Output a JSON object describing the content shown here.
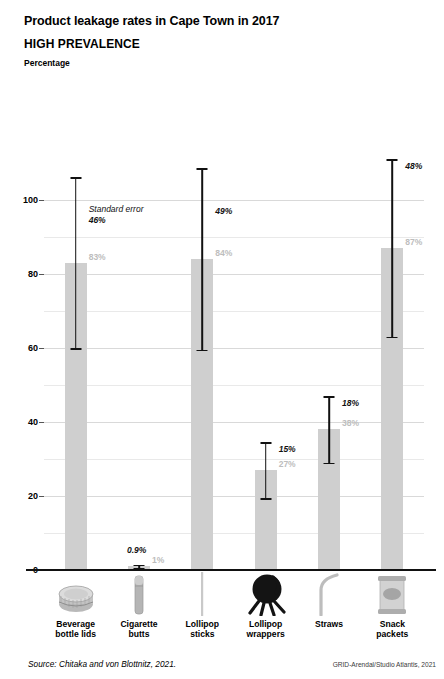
{
  "header": {
    "title": "Product leakage rates in Cape Town in 2017",
    "subtitle": "HIGH PREVALENCE",
    "axis_label": "Percentage"
  },
  "annotation": {
    "standard_error_note": "Standard error"
  },
  "footer": {
    "source": "Source: Chitaka and von Blottnitz, 2021.",
    "credit": "GRID-Arendal/Studio Atlantis, 2021"
  },
  "colors": {
    "bar": "#cfcfcf",
    "bar_label": "#bdbdbd",
    "error_bar": "#111111",
    "grid_major": "#d9d9d9",
    "grid_minor": "#e9e9e9",
    "axis": "#111111",
    "text": "#000000"
  },
  "chart_data": {
    "type": "bar",
    "title": "Product leakage rates in Cape Town in 2017",
    "subtitle": "HIGH PREVALENCE",
    "xlabel": "",
    "ylabel": "Percentage",
    "ylim": [
      0,
      135
    ],
    "yticks": [
      0,
      20,
      40,
      60,
      80,
      100
    ],
    "ytick_labels": [
      "0",
      "20",
      "40",
      "60",
      "80",
      "100"
    ],
    "minor_gridlines": [
      10,
      30,
      50,
      70,
      90
    ],
    "grid": true,
    "legend": false,
    "categories": [
      "Beverage bottle lids",
      "Cigarette butts",
      "Lollipop sticks",
      "Lollipop wrappers",
      "Straws",
      "Snack packets"
    ],
    "category_lines": [
      [
        "Beverage",
        "bottle lids"
      ],
      [
        "Cigarette",
        "butts"
      ],
      [
        "Lollipop",
        "sticks"
      ],
      [
        "Lollipop",
        "wrappers"
      ],
      [
        "Straws",
        ""
      ],
      [
        "Snack",
        "packets"
      ]
    ],
    "category_icons": [
      "bottle-cap-icon",
      "cigarette-butt-icon",
      "lollipop-stick-icon",
      "lollipop-wrapper-icon",
      "straw-icon",
      "snack-packet-icon"
    ],
    "values": [
      83,
      1,
      84,
      27,
      38,
      87
    ],
    "value_labels": [
      "83%",
      "1%",
      "84%",
      "27%",
      "38%",
      "87%"
    ],
    "error_values": [
      46,
      0.9,
      49,
      15,
      18,
      48
    ],
    "error_labels": [
      "46%",
      "0.9%",
      "49%",
      "15%",
      "18%",
      "48%"
    ],
    "error_half_widths": [
      23,
      0.45,
      24.5,
      7.5,
      9,
      24
    ],
    "error_ranges": [
      [
        60,
        106
      ],
      [
        0.55,
        1.45
      ],
      [
        59.5,
        108.5
      ],
      [
        19.5,
        34.5
      ],
      [
        29,
        47
      ],
      [
        63,
        111
      ]
    ]
  }
}
